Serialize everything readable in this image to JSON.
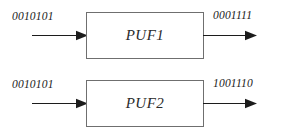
{
  "figure": {
    "width": 290,
    "height": 136,
    "background": "#ffffff",
    "box_border_color": "#6f6f6f",
    "arrow_color": "#1c1c1c",
    "text_color": "#1c1c1c"
  },
  "rows": [
    {
      "id": "puf1",
      "box_label": "PUF1",
      "input_bits": "0010101",
      "output_bits": "0001111"
    },
    {
      "id": "puf2",
      "box_label": "PUF2",
      "input_bits": "0010101",
      "output_bits": "1001110"
    }
  ]
}
